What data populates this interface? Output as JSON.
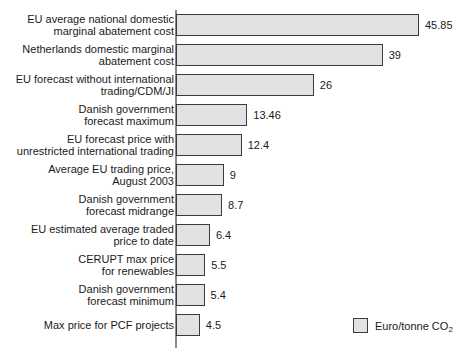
{
  "chart_data": {
    "type": "bar",
    "orientation": "horizontal",
    "title": "",
    "xlabel": "",
    "ylabel": "",
    "grid": false,
    "xlim": [
      0,
      45.85
    ],
    "legend_position": "bottom-right",
    "legend": [
      {
        "label_main": "Euro/tonne CO",
        "label_sub": "2",
        "swatch_color": "#e2e2e2"
      }
    ],
    "categories": [
      "EU average national domestic marginal abatement cost",
      "Netherlands domestic marginal abatement cost",
      "EU forecast without international trading/CDM/JI",
      "Danish government forecast maximum",
      "EU forecast price with unrestricted international trading",
      "Average EU trading price, August 2003",
      "Danish government forecast midrange",
      "EU estimated average traded price to date",
      "CERUPT max price for renewables",
      "Danish government forecast minimum",
      "Max price for PCF projects"
    ],
    "values": [
      45.85,
      39,
      26,
      13.46,
      12.4,
      9,
      8.7,
      6.4,
      5.5,
      5.4,
      4.5
    ],
    "value_labels": [
      "45.85",
      "39",
      "26",
      "13.46",
      "12.4",
      "9",
      "8.7",
      "6.4",
      "5.5",
      "5.4",
      "4.5"
    ],
    "bars": [
      {
        "label_lines": [
          "EU average national domestic",
          "marginal abatement cost"
        ],
        "value": 45.85,
        "value_label": "45.85"
      },
      {
        "label_lines": [
          "Netherlands domestic marginal",
          "abatement cost"
        ],
        "value": 39,
        "value_label": "39"
      },
      {
        "label_lines": [
          "EU forecast without international",
          "trading/CDM/JI"
        ],
        "value": 26,
        "value_label": "26"
      },
      {
        "label_lines": [
          "Danish government",
          "forecast maximum"
        ],
        "value": 13.46,
        "value_label": "13.46"
      },
      {
        "label_lines": [
          "EU forecast price with",
          "unrestricted international trading"
        ],
        "value": 12.4,
        "value_label": "12.4"
      },
      {
        "label_lines": [
          "Average EU trading price,",
          "August 2003"
        ],
        "value": 9,
        "value_label": "9"
      },
      {
        "label_lines": [
          "Danish government",
          "forecast midrange"
        ],
        "value": 8.7,
        "value_label": "8.7"
      },
      {
        "label_lines": [
          "EU estimated average traded",
          "price to date"
        ],
        "value": 6.4,
        "value_label": "6.4"
      },
      {
        "label_lines": [
          "CERUPT max price",
          "for renewables"
        ],
        "value": 5.5,
        "value_label": "5.5"
      },
      {
        "label_lines": [
          "Danish government",
          "forecast minimum"
        ],
        "value": 5.4,
        "value_label": "5.4"
      },
      {
        "label_lines": [
          "Max price for PCF projects"
        ],
        "value": 4.5,
        "value_label": "4.5"
      }
    ],
    "colors": {
      "bar_fill": "#e2e2e2",
      "bar_border": "#3b3b3b",
      "axis": "#8a8a8a",
      "text": "#1a1a1a",
      "background": "#ffffff"
    }
  }
}
